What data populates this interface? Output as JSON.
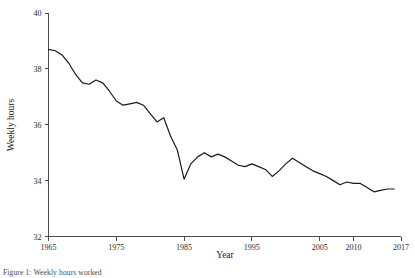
{
  "chart_data": {
    "type": "line",
    "title": "",
    "xlabel": "Year",
    "ylabel": "Weekly hours",
    "xlim": [
      1965,
      2017
    ],
    "ylim": [
      32,
      40
    ],
    "grid": false,
    "legend": null,
    "xticks": [
      1965,
      1975,
      1985,
      1995,
      2005,
      2010,
      2017
    ],
    "xticklabels": [
      "1965",
      "1975",
      "1985",
      "1995",
      "2005",
      "2010",
      "2017"
    ],
    "yticks": [
      32,
      34,
      36,
      38,
      40
    ],
    "yticklabels": [
      "32",
      "34",
      "36",
      "38",
      "40"
    ],
    "series": [
      {
        "name": "Weekly hours",
        "color": "#1a1a1a",
        "x": [
          1965,
          1966,
          1967,
          1968,
          1969,
          1970,
          1971,
          1972,
          1973,
          1974,
          1975,
          1976,
          1977,
          1978,
          1979,
          1980,
          1981,
          1982,
          1983,
          1984,
          1985,
          1986,
          1987,
          1988,
          1989,
          1990,
          1991,
          1992,
          1993,
          1994,
          1995,
          1996,
          1997,
          1998,
          1999,
          2000,
          2001,
          2002,
          2003,
          2004,
          2005,
          2006,
          2007,
          2008,
          2009,
          2010,
          2011,
          2012,
          2013,
          2014,
          2015,
          2016
        ],
        "values": [
          38.7,
          38.65,
          38.5,
          38.2,
          37.8,
          37.5,
          37.45,
          37.6,
          37.5,
          37.2,
          36.85,
          36.7,
          36.75,
          36.8,
          36.7,
          36.4,
          36.1,
          36.25,
          35.6,
          35.1,
          34.05,
          34.6,
          34.85,
          35.0,
          34.85,
          34.95,
          34.85,
          34.7,
          34.55,
          34.5,
          34.6,
          34.5,
          34.4,
          34.15,
          34.35,
          34.6,
          34.8,
          34.65,
          34.5,
          34.35,
          34.25,
          34.15,
          34.0,
          33.85,
          33.95,
          33.9,
          33.9,
          33.75,
          33.6,
          33.65,
          33.7,
          33.7
        ]
      }
    ]
  },
  "caption": {
    "text": "Figure 1: Weekly hours worked"
  }
}
